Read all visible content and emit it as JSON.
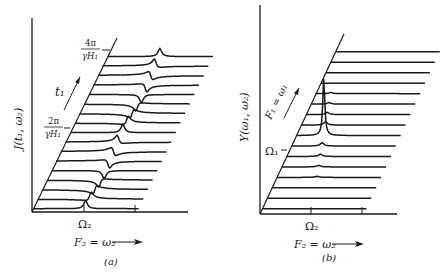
{
  "figure": {
    "panels": [
      {
        "id": "a",
        "caption": "(a)",
        "ylabel": "J(t₁, ω₂)",
        "xlabel": "F₂ = ω₂",
        "depth_label": "t₁",
        "x_tick_label": "Ω₂",
        "depth_ticks": [
          {
            "num": "2π",
            "den": "γH₁"
          },
          {
            "num": "4π",
            "den": "γH₁"
          }
        ],
        "trace_count": 17,
        "description": "Stacked spectra as a function of t1 showing a dispersive line that oscillates in phase with period 2π/γH₁"
      },
      {
        "id": "b",
        "caption": "(b)",
        "ylabel": "Y(ω₁, ω₂)",
        "xlabel": "F₂ = ω₂",
        "depth_label": "F₁ = ω₁",
        "x_tick_label": "Ω₂",
        "depth_tick_label": "Ω₁",
        "trace_count": 16,
        "description": "Two-dimensional spectrum with a single sharp peak at (Ω₁, Ω₂)"
      }
    ]
  }
}
